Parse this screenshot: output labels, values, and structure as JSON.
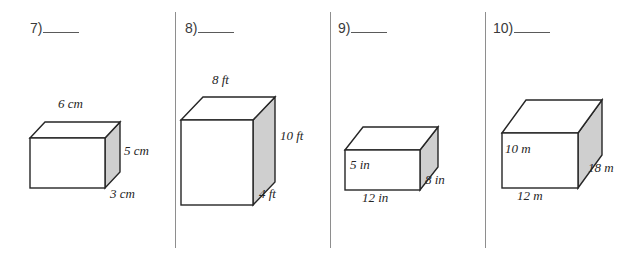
{
  "page": {
    "background_color": "#ffffff",
    "line_color": "#262626",
    "shade_color": "#cfcfcf",
    "divider_color": "#8e8e8e"
  },
  "dividers": [
    {
      "name": "divider-1",
      "x": 175
    },
    {
      "name": "divider-2",
      "x": 330
    },
    {
      "name": "divider-3",
      "x": 485
    }
  ],
  "problems": [
    {
      "number": "7)",
      "blank": "",
      "unit": "cm",
      "figure": "rectangular-prism",
      "labels": {
        "top": "6 cm",
        "right": "5 cm",
        "depth": "3 cm"
      },
      "dimensions": {
        "length": 6,
        "height": 5,
        "depth": 3
      }
    },
    {
      "number": "8)",
      "blank": "",
      "unit": "ft",
      "figure": "rectangular-prism",
      "labels": {
        "top": "8 ft",
        "right": "10 ft",
        "depth": "4 ft"
      },
      "dimensions": {
        "length": 8,
        "height": 10,
        "depth": 4
      }
    },
    {
      "number": "9)",
      "blank": "",
      "unit": "in",
      "figure": "rectangular-prism",
      "labels": {
        "front": "5 in",
        "bottom": "12 in",
        "depth": "8 in"
      },
      "dimensions": {
        "length": 12,
        "height": 5,
        "depth": 8
      }
    },
    {
      "number": "10)",
      "blank": "",
      "unit": "m",
      "figure": "rectangular-prism",
      "labels": {
        "front": "10 m",
        "bottom": "12 m",
        "depth": "18 m"
      },
      "dimensions": {
        "length": 12,
        "height": 10,
        "depth": 18
      }
    }
  ]
}
